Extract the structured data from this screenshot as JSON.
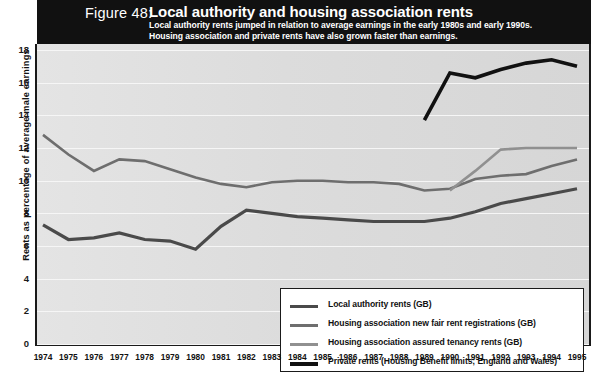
{
  "header": {
    "figure_number": "Figure 48:",
    "title": "Local authority and housing association rents",
    "subtitle_line1": "Local  authority rents jumped in relation to average earnings in the early 1980s and early 1990s.",
    "subtitle_line2": "Housing association and private rents have also grown faster than earnings."
  },
  "colors": {
    "header_bg": "#111111",
    "plot_bg": "#dcdcdc",
    "axis": "#1a1a1a",
    "local_authority": "#4a4a4a",
    "ha_fair_rent": "#6e6e6e",
    "ha_assured": "#909090",
    "private_rents": "#111111"
  },
  "legend": {
    "items": [
      {
        "label": "Local authority rents (GB)",
        "color": "#4a4a4a",
        "width": 3.2
      },
      {
        "label": "Housing association new fair rent registrations (GB)",
        "color": "#6e6e6e",
        "width": 2.6
      },
      {
        "label": "Housing association assured tenancy rents (GB)",
        "color": "#909090",
        "width": 2.6
      },
      {
        "label": "Private rents (Housing Benefit limits; England and Wales)",
        "color": "#111111",
        "width": 3.6
      }
    ]
  },
  "chart_data": {
    "type": "line",
    "title": "Local authority and housing association rents",
    "xlabel": "",
    "ylabel": "Rents as percentage of average male earnings",
    "ylim": [
      0,
      18
    ],
    "yticks": [
      0,
      2,
      4,
      6,
      8,
      10,
      12,
      14,
      16,
      18
    ],
    "grid": true,
    "legend_position": "inside-bottom-right",
    "x": [
      1974,
      1975,
      1976,
      1977,
      1978,
      1979,
      1980,
      1981,
      1982,
      1983,
      1984,
      1985,
      1986,
      1987,
      1988,
      1989,
      1990,
      1991,
      1992,
      1993,
      1994,
      1995
    ],
    "xtick_labels": [
      "1974",
      "1975",
      "1976",
      "1977",
      "1978",
      "1979",
      "1980",
      "1981",
      "1982",
      "1983",
      "1984",
      "1985",
      "1986",
      "1987",
      "1988",
      "1989",
      "1990",
      "1991",
      "1992",
      "1993",
      "1994",
      "1995"
    ],
    "series": [
      {
        "name": "Local authority rents (GB)",
        "color": "#4a4a4a",
        "values": [
          7.3,
          6.4,
          6.5,
          6.8,
          6.4,
          6.3,
          5.8,
          7.2,
          8.2,
          8.0,
          7.8,
          7.7,
          7.6,
          7.5,
          7.5,
          7.5,
          7.7,
          8.1,
          8.6,
          8.9,
          9.2,
          9.5
        ]
      },
      {
        "name": "Housing association new fair rent registrations (GB)",
        "color": "#6e6e6e",
        "values": [
          12.8,
          11.6,
          10.6,
          11.3,
          11.2,
          10.7,
          10.2,
          9.8,
          9.6,
          9.9,
          10.0,
          10.0,
          9.9,
          9.9,
          9.8,
          9.4,
          9.5,
          10.1,
          10.3,
          10.4,
          10.9,
          11.3
        ]
      },
      {
        "name": "Housing association assured tenancy rents (GB)",
        "color": "#909090",
        "values": [
          null,
          null,
          null,
          null,
          null,
          null,
          null,
          null,
          null,
          null,
          null,
          null,
          null,
          null,
          null,
          null,
          9.4,
          10.6,
          11.9,
          12.0,
          12.0,
          12.0
        ]
      },
      {
        "name": "Private rents (Housing Benefit limits; England and Wales)",
        "color": "#111111",
        "values": [
          null,
          null,
          null,
          null,
          null,
          null,
          null,
          null,
          null,
          null,
          null,
          null,
          null,
          null,
          null,
          13.7,
          16.6,
          16.3,
          16.8,
          17.2,
          17.4,
          17.0
        ]
      }
    ]
  }
}
